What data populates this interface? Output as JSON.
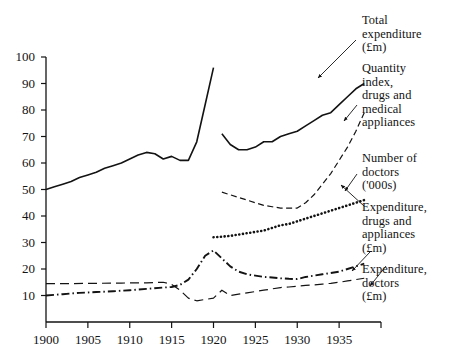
{
  "chart_data": {
    "type": "line",
    "title": "",
    "xlabel": "",
    "ylabel": "",
    "xlim": [
      1900,
      1940
    ],
    "ylim": [
      0,
      100
    ],
    "grid": false,
    "legend_position": "right-annotations",
    "xticks": [
      1900,
      1905,
      1910,
      1915,
      1920,
      1925,
      1930,
      1935
    ],
    "yticks": [
      10,
      20,
      30,
      40,
      50,
      60,
      70,
      80,
      90,
      100
    ],
    "series": [
      {
        "name": "Total expenditure (£m)",
        "style": "solid",
        "x": [
          1900,
          1901,
          1902,
          1903,
          1904,
          1905,
          1906,
          1907,
          1908,
          1909,
          1910,
          1911,
          1912,
          1913,
          1914,
          1915,
          1916,
          1917,
          1918,
          1919,
          1920
        ],
        "values": [
          50,
          51,
          52,
          53,
          54.5,
          55.5,
          56.5,
          58,
          59,
          60,
          61.5,
          63,
          64,
          63.5,
          61.5,
          62.5,
          61,
          61,
          68,
          82,
          96
        ]
      },
      {
        "name": "Total expenditure (£m) continued",
        "style": "solid",
        "x": [
          1921,
          1922,
          1923,
          1924,
          1925,
          1926,
          1927,
          1928,
          1929,
          1930,
          1931,
          1932,
          1933,
          1934,
          1935,
          1936,
          1937,
          1938
        ],
        "values": [
          71,
          67,
          65,
          65,
          66,
          68,
          68,
          70,
          71,
          72,
          74,
          76,
          78,
          79,
          82,
          85,
          88,
          90
        ]
      },
      {
        "name": "Quantity index, drugs and medical appliances",
        "style": "dashed",
        "x": [
          1921,
          1922,
          1923,
          1924,
          1925,
          1926,
          1927,
          1928,
          1929,
          1930,
          1931,
          1932,
          1933,
          1934,
          1935,
          1936,
          1937,
          1938
        ],
        "values": [
          49,
          48,
          47,
          46,
          45,
          44,
          43.5,
          43,
          43,
          43,
          45,
          48,
          52,
          56,
          61,
          66,
          72,
          79
        ]
      },
      {
        "name": "Expenditure, drugs and appliances (£m)",
        "style": "dotted",
        "x": [
          1920,
          1921,
          1922,
          1923,
          1924,
          1925,
          1926,
          1927,
          1928,
          1929,
          1930,
          1931,
          1932,
          1933,
          1934,
          1935,
          1936,
          1937,
          1938
        ],
        "values": [
          32,
          32.2,
          32.5,
          33,
          33.5,
          34,
          34.5,
          35.5,
          36.5,
          37,
          38,
          39,
          40,
          41,
          42,
          43,
          44,
          45,
          46
        ]
      },
      {
        "name": "Expenditure, doctors (£m)",
        "style": "dashdot",
        "x": [
          1900,
          1902,
          1904,
          1906,
          1908,
          1910,
          1912,
          1914,
          1915,
          1916,
          1917,
          1918,
          1919,
          1920,
          1921,
          1922,
          1923,
          1924,
          1925,
          1926,
          1927,
          1928,
          1929,
          1930,
          1931,
          1932,
          1933,
          1934,
          1935,
          1936,
          1937,
          1938
        ],
        "values": [
          10,
          10.5,
          11,
          11.3,
          11.6,
          12,
          12.5,
          13,
          13.2,
          14,
          16,
          20,
          25,
          27,
          24,
          21,
          19,
          18,
          17.5,
          17,
          16.8,
          16.5,
          16.3,
          16.2,
          17,
          17.5,
          18,
          18.5,
          19,
          20,
          21,
          22
        ]
      },
      {
        "name": "Number of doctors ('000s)",
        "style": "longdash",
        "x": [
          1900,
          1903,
          1906,
          1909,
          1912,
          1914,
          1915,
          1916,
          1917,
          1918,
          1919,
          1920,
          1921,
          1922,
          1923,
          1924,
          1925,
          1926,
          1927,
          1928,
          1929,
          1930,
          1931,
          1932,
          1933,
          1934,
          1935,
          1936,
          1937,
          1938
        ],
        "values": [
          14.5,
          14.5,
          14.6,
          14.7,
          14.8,
          15,
          14.2,
          12,
          9,
          8,
          8.5,
          9,
          12,
          10,
          10.5,
          11,
          11.5,
          12,
          12.5,
          13,
          13.2,
          13.5,
          13.8,
          14,
          14.3,
          14.6,
          15,
          15.5,
          16,
          16.5
        ]
      }
    ],
    "annotations": [
      {
        "text": "Total\nexpenditure\n(£m)",
        "target_series": "Total expenditure (£m)"
      },
      {
        "text": "Quantity\nindex,\ndrugs and\nmedical\nappliances",
        "target_series": "Quantity index, drugs and medical appliances"
      },
      {
        "text": "Number of\ndoctors\n('000s)",
        "target_series": "Number of doctors ('000s)"
      },
      {
        "text": "Expenditure,\ndrugs and\nappliances\n(£m)",
        "target_series": "Expenditure, drugs and appliances (£m)"
      },
      {
        "text": "Expenditure,\ndoctors\n(£m)",
        "target_series": "Expenditure, doctors (£m)"
      }
    ]
  },
  "axes": {
    "y_labels": [
      "100",
      "90",
      "80",
      "70",
      "60",
      "50",
      "40",
      "30",
      "20",
      "10"
    ],
    "x_labels": [
      "1900",
      "1905",
      "1910",
      "1915",
      "1920",
      "1925",
      "1930",
      "1935"
    ]
  },
  "annotation_labels": {
    "total_expenditure": "Total\nexpenditure\n(£m)",
    "quantity_index": "Quantity\nindex,\ndrugs and\nmedical\nappliances",
    "number_doctors": "Number of\ndoctors\n('000s)",
    "expenditure_drugs": "Expenditure,\ndrugs and\nappliances\n(£m)",
    "expenditure_doctors": "Expenditure,\ndoctors\n(£m)"
  },
  "colors": {
    "ink": "#131313",
    "background": "#ffffff"
  }
}
